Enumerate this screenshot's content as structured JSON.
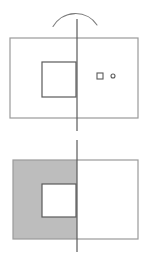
{
  "figure": {
    "background_color": "#ffffff",
    "shade_color": "#bdbdbd",
    "card_stroke_color": "#9a9a9a",
    "detail_stroke_color": "#5a5a5a",
    "arc_stroke_color": "#7d7d7d",
    "canvas": {
      "width": 148,
      "height": 261
    },
    "top_panel": {
      "rotation_arc": {
        "d": "M 53 26.5 A 26 26 0 0 1 97 25"
      },
      "axis_line": {
        "x1": 77,
        "y1": 19,
        "x2": 77,
        "y2": 131
      },
      "card_outline": {
        "x": 10,
        "y": 38,
        "width": 128,
        "height": 80,
        "fill": "#ffffff"
      },
      "inner_square": {
        "x": 42,
        "y": 62,
        "width": 34,
        "height": 35,
        "fill": "none"
      },
      "marker_square": {
        "x": 97,
        "y": 73,
        "width": 6,
        "height": 6,
        "fill": "none"
      },
      "marker_circle": {
        "cx": 113,
        "cy": 76,
        "r": 2,
        "fill": "none"
      }
    },
    "bottom_panel": {
      "axis_line": {
        "x1": 77,
        "y1": 140,
        "x2": 77,
        "y2": 252
      },
      "card_outline": {
        "x": 13,
        "y": 160,
        "width": 125,
        "height": 79,
        "fill": "none"
      },
      "shaded_left_half_with_hole": {
        "d": "M 13 160 H 77 V 239 H 13 Z M 42 184 H 76 V 217 H 42 Z"
      },
      "square_hole_outline": {
        "x": 42,
        "y": 184,
        "width": 34,
        "height": 33,
        "fill": "none"
      }
    }
  }
}
